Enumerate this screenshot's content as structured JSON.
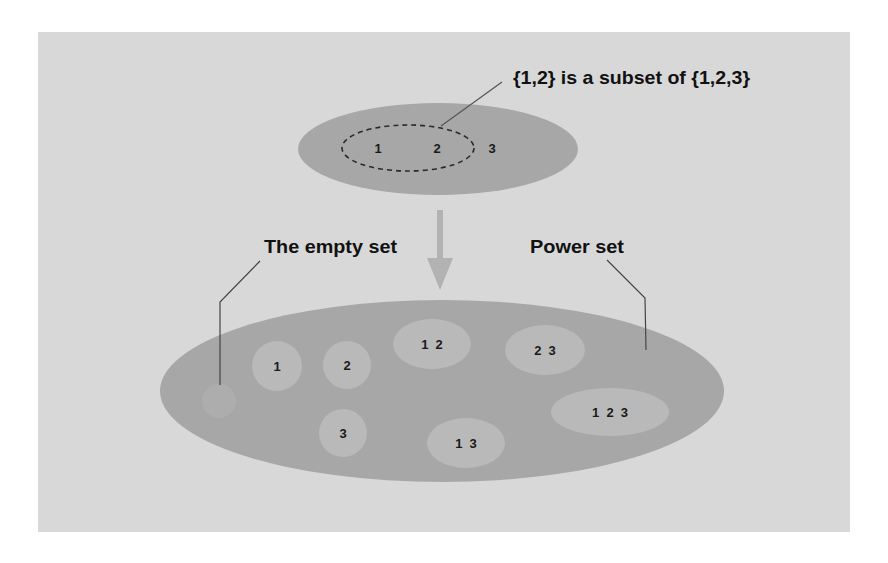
{
  "diagram": {
    "title_label": "{1,2} is a subset of {1,2,3}",
    "empty_set_label": "The empty set",
    "power_set_label": "Power set",
    "top_set": {
      "elements": [
        "1",
        "2",
        "3"
      ],
      "subset_elements": [
        "1",
        "2"
      ]
    },
    "power_set_members": [
      {
        "label": "",
        "description": "empty set"
      },
      {
        "label": "1"
      },
      {
        "label": "2"
      },
      {
        "label": "3"
      },
      {
        "label": "1  2"
      },
      {
        "label": "2  3"
      },
      {
        "label": "1  3"
      },
      {
        "label": "1  2  3"
      }
    ],
    "colors": {
      "page_background": "#ffffff",
      "panel": "#d8d8d8",
      "set_fill": "#a7a7a7",
      "subset_fill": "#b9b9b9",
      "arrow": "#b2b2b2",
      "leader_line": "#444444",
      "text": "#111111"
    }
  }
}
